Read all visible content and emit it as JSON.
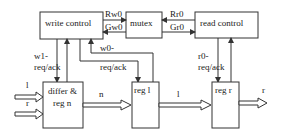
{
  "diagram": {
    "blocks": {
      "write_control": "write control",
      "mutex": "mutex",
      "read_control": "read control",
      "differ_reg_n_line1": "differ &",
      "differ_reg_n_line2": "reg n",
      "reg_l": "reg l",
      "reg_r": "reg r"
    },
    "signals": {
      "rw0": "Rw0",
      "gw0": "Gw0",
      "rr0": "Rr0",
      "gr0": "Gr0",
      "w1_line1": "w1-",
      "w1_line2": "req/ack",
      "w0_line1": "w0-",
      "w0_line2": "req/ack",
      "r0_line1": "r0-",
      "r0_line2": "req/ack"
    },
    "data_paths": {
      "input_l": "l",
      "input_r": "r",
      "n": "n",
      "l": "l",
      "output_r": "r"
    }
  }
}
